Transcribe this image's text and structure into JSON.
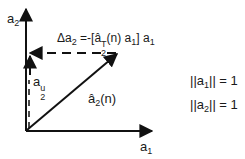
{
  "diagram": {
    "type": "vector-decomposition",
    "axes": {
      "vertical": {
        "label_base": "a",
        "label_sub": "2"
      },
      "horizontal": {
        "label_base": "a",
        "label_sub": "1"
      }
    },
    "vectors": {
      "estimate": {
        "label_base": "â",
        "label_sub": "2",
        "label_suffix": "(n)"
      },
      "update_component": {
        "label_base": "a",
        "label_sub": "2",
        "label_sup": "u"
      }
    },
    "equation": {
      "lhs_base": "Δa",
      "lhs_sub": "2",
      "eq": " =-[",
      "term_base": "â",
      "term_sup": "T",
      "term_sub": "2",
      "term_rest": "(n) a",
      "term_rest_sub": "1",
      "close": "] a",
      "close_sub": "1"
    },
    "constraints": [
      {
        "prefix": "||a",
        "sub": "1",
        "suffix": "|| = 1"
      },
      {
        "prefix": "||a",
        "sub": "2",
        "suffix": "|| = 1"
      }
    ],
    "colors": {
      "ink": "#111111",
      "background": "#ffffff"
    }
  }
}
